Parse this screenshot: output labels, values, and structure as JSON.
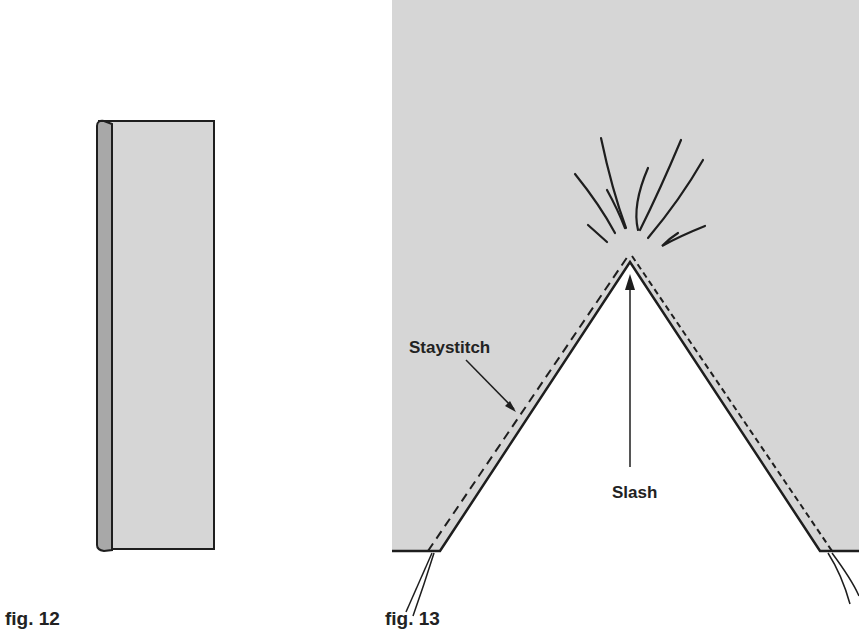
{
  "figures": [
    {
      "id": "fig12",
      "caption": "fig. 12",
      "description": "Folded strip of fabric showing folded edge on left"
    },
    {
      "id": "fig13",
      "caption": "fig. 13",
      "labels": {
        "staystitch": "Staystitch",
        "slash": "Slash"
      }
    }
  ],
  "colors": {
    "fabric": "#d6d6d6",
    "fold": "#a8a8a8",
    "line": "#1e1e1e",
    "background": "#ffffff"
  }
}
